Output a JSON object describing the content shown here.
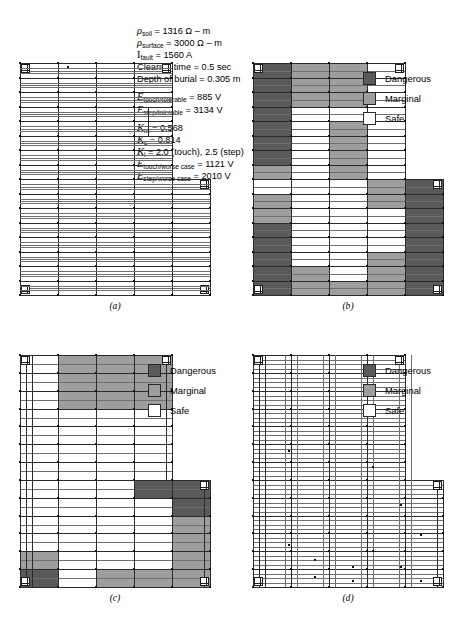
{
  "figure": {
    "panels": [
      "(a)",
      "(b)",
      "(c)",
      "(d)"
    ]
  },
  "parameters": {
    "lines": [
      {
        "sym": "ρ",
        "subscript": "soil",
        "rest": " = 1316 Ω – m",
        "italic": true
      },
      {
        "sym": "ρ",
        "subscript": "surface",
        "rest": " = 3000 Ω – m",
        "italic": true
      },
      {
        "sym": "I",
        "subscript": "fault",
        "rest": " = 1560 A",
        "italic": false
      },
      {
        "sym": "",
        "subscript": "",
        "rest": "Clearing time = 0.5 sec",
        "italic": false
      },
      {
        "sym": "",
        "subscript": "",
        "rest": "Depth of burial = 0.305 m",
        "italic": false
      },
      {
        "sym": "E",
        "subscript": "touch/tolerable",
        "rest": " = 885 V",
        "italic": true
      },
      {
        "sym": "E",
        "subscript": "step/tolerable",
        "rest": " = 3134 V",
        "italic": true
      },
      {
        "sym": "K",
        "subscript": "m",
        "rest": " = 0.568",
        "italic": true
      },
      {
        "sym": "K",
        "subscript": "s",
        "rest": " = 0.814",
        "italic": true
      },
      {
        "sym": "K",
        "subscript": "i",
        "rest": " = 2.0 (touch), 2.5 (step)",
        "italic": true
      },
      {
        "sym": "E",
        "subscript": "touch/worse case",
        "rest": " = 1121 V",
        "italic": true
      },
      {
        "sym": "E",
        "subscript": "step/worse case",
        "rest": " = 2010 V",
        "italic": true
      }
    ],
    "values": {
      "rho_soil": "1316 Ω – m",
      "rho_surface": "3000 Ω – m",
      "i_fault": "1560 A",
      "clearing_time": "0.5 sec",
      "depth_of_burial": "0.305 m",
      "e_touch_tolerable": "885 V",
      "e_step_tolerable": "3134 V",
      "k_m": "0.568",
      "k_s": "0.814",
      "k_i": "2.0 (touch), 2.5 (step)",
      "e_touch_worse_case": "1121 V",
      "e_step_worse_case": "2010 V"
    }
  },
  "legend": {
    "items": [
      {
        "label": "Dangerous",
        "color": "#5a5a5a"
      },
      {
        "label": "Marginal",
        "color": "#9e9e9e"
      },
      {
        "label": "Safe",
        "color": "#ffffff"
      }
    ]
  },
  "colors": {
    "dangerous": "#5a5a5a",
    "marginal": "#9e9e9e",
    "safe": "#ffffff",
    "grid_line": "#2b2b2b",
    "grid_line_light": "#6f6f6f",
    "node": "#111111"
  },
  "chart_data": {
    "type": "heatmap",
    "legend_position": "right",
    "categories": [
      "Dangerous",
      "Marginal",
      "Safe"
    ],
    "panels": [
      {
        "id": "a",
        "label": "(a)",
        "description": "Bare grounding grid layout, L-shaped, no voltage shading",
        "shaded": false,
        "rows": 14,
        "cols": 5
      },
      {
        "id": "b",
        "label": "(b)",
        "description": "Touch voltage profile, original grid",
        "shaded": true,
        "cells": [
          [
            "dangerous",
            "marginal",
            "marginal",
            "safe",
            "safe"
          ],
          [
            "dangerous",
            "marginal",
            "marginal",
            "safe",
            "safe"
          ],
          [
            "dangerous",
            "marginal",
            "marginal",
            "safe",
            "safe"
          ],
          [
            "dangerous",
            "safe",
            "safe",
            "safe",
            "safe"
          ],
          [
            "dangerous",
            "safe",
            "marginal",
            "safe",
            "safe"
          ],
          [
            "dangerous",
            "safe",
            "marginal",
            "safe",
            "safe"
          ],
          [
            "dangerous",
            "safe",
            "marginal",
            "safe",
            "safe"
          ],
          [
            "marginal",
            "safe",
            "marginal",
            "safe",
            "safe"
          ],
          [
            "safe",
            "safe",
            "safe",
            "marginal",
            "dangerous"
          ],
          [
            "marginal",
            "safe",
            "safe",
            "marginal",
            "dangerous"
          ],
          [
            "marginal",
            "safe",
            "safe",
            "safe",
            "dangerous"
          ],
          [
            "dangerous",
            "safe",
            "safe",
            "safe",
            "dangerous"
          ],
          [
            "dangerous",
            "safe",
            "safe",
            "safe",
            "dangerous"
          ],
          [
            "dangerous",
            "safe",
            "safe",
            "marginal",
            "dangerous"
          ],
          [
            "dangerous",
            "marginal",
            "safe",
            "marginal",
            "dangerous"
          ],
          [
            "dangerous",
            "marginal",
            "marginal",
            "marginal",
            "dangerous"
          ]
        ]
      },
      {
        "id": "c",
        "label": "(c)",
        "description": "Touch voltage profile, refined grid spacing",
        "shaded": true,
        "cells": [
          [
            "safe",
            "marginal",
            "marginal",
            "marginal",
            "safe"
          ],
          [
            "safe",
            "marginal",
            "marginal",
            "marginal",
            "dangerous"
          ],
          [
            "safe",
            "marginal",
            "marginal",
            "marginal",
            "dangerous"
          ],
          [
            "safe",
            "safe",
            "safe",
            "safe",
            "marginal"
          ],
          [
            "safe",
            "safe",
            "safe",
            "safe",
            "marginal"
          ],
          [
            "safe",
            "safe",
            "safe",
            "safe",
            "safe"
          ],
          [
            "safe",
            "safe",
            "safe",
            "safe",
            "safe"
          ],
          [
            "safe",
            "safe",
            "safe",
            "dangerous",
            "dangerous"
          ],
          [
            "safe",
            "safe",
            "safe",
            "safe",
            "dangerous"
          ],
          [
            "safe",
            "safe",
            "safe",
            "safe",
            "marginal"
          ],
          [
            "safe",
            "safe",
            "safe",
            "safe",
            "marginal"
          ],
          [
            "marginal",
            "safe",
            "safe",
            "safe",
            "marginal"
          ],
          [
            "dangerous",
            "safe",
            "marginal",
            "marginal",
            "marginal"
          ]
        ]
      },
      {
        "id": "d",
        "label": "(d)",
        "description": "Touch voltage profile, final dense mesh — all safe",
        "shaded": false,
        "all_safe": true,
        "rows": 16,
        "cols": 7
      }
    ]
  }
}
